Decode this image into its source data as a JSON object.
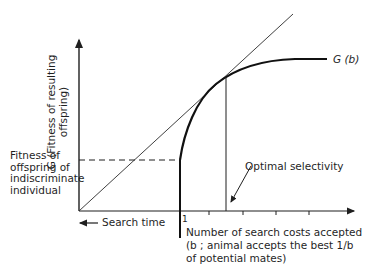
{
  "diagram": {
    "y_axis_label_line1": "G (Fitness of resulting",
    "y_axis_label_line2": "offspring)",
    "x_axis_label_line1": "Number of search costs accepted",
    "x_axis_label_line2": "(b ; animal accepts the best  1/b",
    "x_axis_label_line3": "of potential mates)",
    "curve_label": "G (b)",
    "tick_one_label": "1",
    "search_time_label": "Search time",
    "indiscriminate_label_line1": "Fitness of",
    "indiscriminate_label_line2": "offspring of",
    "indiscriminate_label_line3": "indiscriminate",
    "indiscriminate_label_line4": "individual",
    "optimal_label": "Optimal selectivity",
    "colors": {
      "ink": "#1f1f1f",
      "background": "#ffffff"
    }
  }
}
